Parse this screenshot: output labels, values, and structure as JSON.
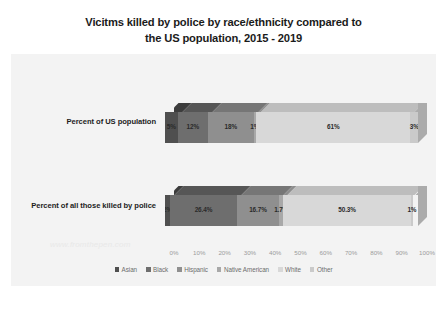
{
  "chart_data": {
    "type": "bar",
    "orientation": "horizontal",
    "stacked": "100%",
    "three_d": true,
    "title_line_1": "Vicitms killed by police by race/ethnicity compared to",
    "title_line_2": "the US population, 2015 - 2019",
    "xlabel": "",
    "ylabel": "",
    "xlim": [
      0,
      100
    ],
    "grid": false,
    "legend_position": "bottom",
    "categories": [
      "Percent of US population",
      "Percent of all those killed by police"
    ],
    "tick_labels": [
      "0%",
      "10%",
      "20%",
      "30%",
      "40%",
      "50%",
      "60%",
      "70%",
      "80%",
      "90%",
      "100%"
    ],
    "tick_values": [
      0,
      10,
      20,
      30,
      40,
      50,
      60,
      70,
      80,
      90,
      100
    ],
    "series": [
      {
        "name": "Asian",
        "color": "#4f4f4f",
        "top_color": "#3c3c3c",
        "values": [
          5,
          2
        ],
        "labels": [
          "5%",
          "2%"
        ]
      },
      {
        "name": "Black",
        "color": "#6e6e6e",
        "top_color": "#565656",
        "values": [
          12,
          26.4
        ],
        "labels": [
          "12%",
          "26.4%"
        ]
      },
      {
        "name": "Hispanic",
        "color": "#8f8f8f",
        "top_color": "#767676",
        "values": [
          18,
          16.7
        ],
        "labels": [
          "18%",
          "16.7%"
        ]
      },
      {
        "name": "Native American",
        "color": "#a8a8a8",
        "top_color": "#8d8d8d",
        "values": [
          1,
          1.7
        ],
        "labels": [
          "1%",
          "1.7%"
        ]
      },
      {
        "name": "White",
        "color": "#d8d8d8",
        "top_color": "#bdbdbd",
        "values": [
          61,
          50.3
        ],
        "labels": [
          "61%",
          "50.3%"
        ]
      },
      {
        "name": "Other",
        "color": "#cacaca",
        "top_color": "#ababab",
        "values": [
          3,
          1
        ],
        "labels": [
          "3%",
          "1%"
        ]
      }
    ]
  },
  "watermark": "www.fromthepen.com",
  "colors": {
    "panel": "#f3f3f3",
    "page": "#ffffff",
    "title": "#1b1b1b",
    "tick": "#9b9b9b",
    "legend_text": "#6d6d6d"
  }
}
